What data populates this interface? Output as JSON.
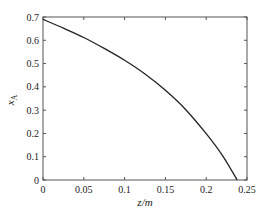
{
  "chart_data": {
    "type": "line",
    "title": "",
    "xlabel": "z/m",
    "ylabel": "x_A",
    "ylabel_main": "x",
    "ylabel_sub": "A",
    "xlim": [
      0,
      0.25
    ],
    "ylim": [
      0,
      0.7
    ],
    "xticks": [
      0,
      0.05,
      0.1,
      0.15,
      0.2,
      0.25
    ],
    "xtick_labels": [
      "0",
      "0.05",
      "0.1",
      "0.15",
      "0.2",
      "0.25"
    ],
    "yticks": [
      0,
      0.1,
      0.2,
      0.3,
      0.4,
      0.5,
      0.6,
      0.7
    ],
    "ytick_labels": [
      "0",
      "0.1",
      "0.2",
      "0.3",
      "0.4",
      "0.5",
      "0.6",
      "0.7"
    ],
    "grid": false,
    "legend": null,
    "series": [
      {
        "name": "x_A",
        "color": "#222222",
        "x": [
          0,
          0.025,
          0.05,
          0.075,
          0.1,
          0.125,
          0.15,
          0.175,
          0.2,
          0.22,
          0.238
        ],
        "y": [
          0.69,
          0.652,
          0.612,
          0.565,
          0.514,
          0.455,
          0.385,
          0.302,
          0.199,
          0.105,
          0.0
        ]
      }
    ]
  },
  "colors": {
    "axis": "#555555",
    "line": "#222222",
    "text": "#222222"
  }
}
